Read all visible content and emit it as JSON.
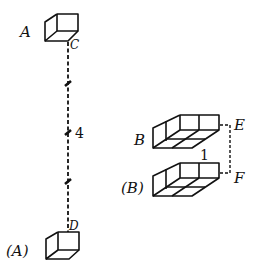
{
  "labels": {
    "a": "A",
    "c": "C",
    "a_paren": "(A)",
    "d": "D",
    "b": "B",
    "b_paren": "(B)",
    "e": "E",
    "f": "F",
    "length_cd": "4",
    "length_ef": "1"
  },
  "colors": {
    "ink": "#111111",
    "background": "#ffffff"
  }
}
